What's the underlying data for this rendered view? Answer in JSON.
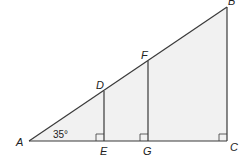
{
  "diagram": {
    "type": "geometry",
    "colors": {
      "stroke": "#3a3a3a",
      "fill": "#f1f1f1",
      "text": "#222222"
    },
    "points": {
      "A": {
        "label": "A",
        "x": 29,
        "y": 141
      },
      "B": {
        "label": "B",
        "x": 227,
        "y": 7
      },
      "C": {
        "label": "C",
        "x": 227,
        "y": 141
      },
      "D": {
        "label": "D",
        "x": 104,
        "y": 91
      },
      "E": {
        "label": "E",
        "x": 104,
        "y": 141
      },
      "F": {
        "label": "F",
        "x": 148,
        "y": 61
      },
      "G": {
        "label": "G",
        "x": 148,
        "y": 141
      }
    },
    "segments": [
      "AB",
      "AC",
      "BC",
      "DE",
      "FG"
    ],
    "right_angles": [
      "E",
      "G",
      "C"
    ],
    "angle": {
      "vertex": "A",
      "label": "35°"
    }
  }
}
